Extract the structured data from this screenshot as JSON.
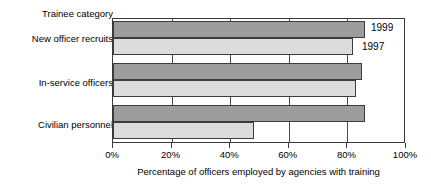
{
  "chart_data": {
    "type": "bar",
    "orientation": "horizontal",
    "title": "",
    "category_axis_label": "Trainee category",
    "xlabel": "Percentage of officers employed by agencies with training",
    "ylabel": "",
    "categories": [
      "New officer recruits",
      "In-service officers",
      "Civilian personnel"
    ],
    "series": [
      {
        "name": "1999",
        "color": "#9d9d9d",
        "values": [
          86,
          85,
          86
        ]
      },
      {
        "name": "1997",
        "color": "#dcdcdc",
        "values": [
          82,
          83,
          48
        ]
      }
    ],
    "xlim": [
      0,
      100
    ],
    "xticks": [
      0,
      20,
      40,
      60,
      80,
      100
    ],
    "xtick_labels": [
      "0%",
      "20%",
      "40%",
      "60%",
      "80%",
      "100%"
    ],
    "grid": true,
    "grid_axis": "x",
    "legend": "inline-annotations",
    "annotations": [
      {
        "text": "1999",
        "series": "1999"
      },
      {
        "text": "1997",
        "series": "1997"
      }
    ]
  }
}
